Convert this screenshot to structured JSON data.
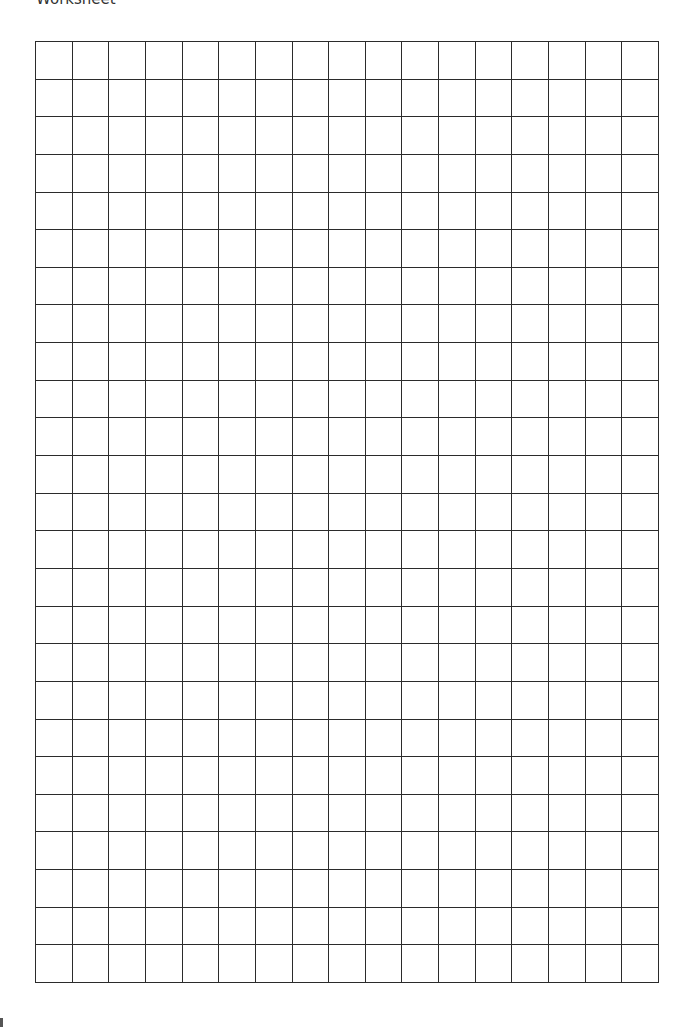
{
  "document": {
    "title": "Worksheet",
    "grid": {
      "columns": 17,
      "rows": 25,
      "line_color": "#2b2b2b",
      "background": "#ffffff"
    }
  }
}
